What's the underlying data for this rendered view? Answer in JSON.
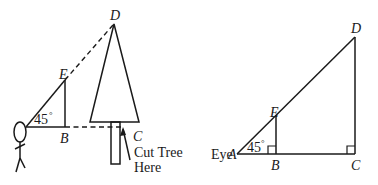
{
  "left_figure": {
    "labels": {
      "D": "D",
      "E": "E",
      "B": "B",
      "C": "C",
      "angle": "45",
      "degree": "°",
      "cut_line1": "Cut Tree",
      "cut_line2": "Here"
    }
  },
  "right_figure": {
    "labels": {
      "eye": "Eye",
      "A": "A",
      "D": "D",
      "E": "E",
      "B": "B",
      "C": "C",
      "angle": "45",
      "degree": "°"
    }
  },
  "colors": {
    "ink": "#1a1a1a",
    "background": "#ffffff"
  }
}
